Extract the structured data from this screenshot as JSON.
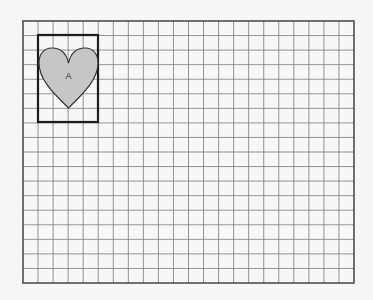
{
  "grid": {
    "left": 23,
    "top": 21,
    "right": 354,
    "bottom": 283,
    "cols": 22,
    "rows": 18,
    "line_color": "#7a7a7a",
    "border_color": "#444444"
  },
  "figure": {
    "rect": {
      "x": 38,
      "y": 35,
      "width": 60,
      "height": 87,
      "stroke": "#1e1e1e"
    },
    "heart": {
      "fill": "#c6c6c6",
      "stroke": "#333333"
    },
    "label": "A"
  }
}
